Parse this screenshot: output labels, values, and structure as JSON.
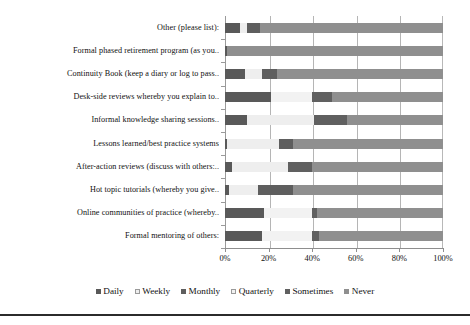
{
  "chart_data": {
    "type": "bar",
    "orientation": "horizontal",
    "stacked": true,
    "normalized": true,
    "title": "",
    "xlabel": "",
    "ylabel": "",
    "xlim": [
      0,
      100
    ],
    "xticks": [
      "0%",
      "20%",
      "40%",
      "60%",
      "80%",
      "100%"
    ],
    "xtick_values": [
      0,
      20,
      40,
      60,
      80,
      100
    ],
    "grid": true,
    "legend_position": "bottom",
    "categories": [
      "Other (please list):",
      "Formal phased retirement program (as you..",
      "Continuity Book (keep a diary or log to pass..",
      "Desk-side reviews whereby you explain to..",
      "Informal knowledge sharing sessions..",
      "Lessons learned/best practice systems",
      "After-action reviews (discuss with others:..",
      "Hot topic tutorials (whereby you give..",
      "Online communities of practice (whereby..",
      "Formal mentoring of others:"
    ],
    "series": [
      {
        "name": "Daily",
        "color": "#595959",
        "values": [
          7,
          1,
          9,
          21,
          10,
          1,
          3,
          2,
          18,
          17
        ]
      },
      {
        "name": "Weekly",
        "color": "#eeeeee",
        "values": [
          3,
          0,
          8,
          0,
          31,
          24,
          26,
          13,
          0,
          0
        ]
      },
      {
        "name": "Monthly",
        "color": "#5e5e5e",
        "values": [
          6,
          0,
          7,
          0,
          0,
          6,
          0,
          16,
          0,
          0
        ]
      },
      {
        "name": "Quarterly",
        "color": "#f2f2f2",
        "values": [
          0,
          0,
          0,
          19,
          0,
          0,
          0,
          0,
          22,
          23
        ]
      },
      {
        "name": "Sometimes",
        "color": "#606060",
        "values": [
          0,
          0,
          0,
          9,
          15,
          0,
          11,
          0,
          2,
          3
        ]
      },
      {
        "name": "Never",
        "color": "#8f8f8f",
        "values": [
          84,
          99,
          76,
          51,
          44,
          69,
          60,
          69,
          58,
          57
        ]
      }
    ]
  },
  "legend": {
    "items": [
      {
        "label": "Daily"
      },
      {
        "label": "Weekly"
      },
      {
        "label": "Monthly"
      },
      {
        "label": "Quarterly"
      },
      {
        "label": "Sometimes"
      },
      {
        "label": "Never"
      }
    ]
  }
}
